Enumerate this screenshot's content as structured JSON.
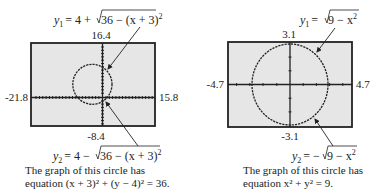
{
  "panels": [
    {
      "id": "left",
      "window": {
        "xmin": "-21.8",
        "xmax": "15.8",
        "ymin": "-8.4",
        "ymax": "16.4"
      },
      "top_equation": {
        "lhs": "y",
        "sub": "1",
        "rhs_prefix": "= 4 + ",
        "radicand": "36 − (x + 3)",
        "exp": "2"
      },
      "bottom_equation": {
        "lhs": "y",
        "sub": "2",
        "rhs_prefix": "= 4 − ",
        "radicand": "36 − (x + 3)",
        "exp": "2"
      },
      "caption_line1": "The graph of this circle has",
      "caption_line2": "equation (x + 3)² + (y − 4)² = 36.",
      "circle": {
        "center_x": -3,
        "center_y": 4,
        "radius": 6
      }
    },
    {
      "id": "right",
      "window": {
        "xmin": "-4.7",
        "xmax": "4.7",
        "ymin": "-3.1",
        "ymax": "3.1"
      },
      "top_equation": {
        "lhs": "y",
        "sub": "1",
        "rhs_prefix": "= ",
        "radicand": "9 − x",
        "exp": "2"
      },
      "bottom_equation": {
        "lhs": "y",
        "sub": "2",
        "rhs_prefix": "= −",
        "radicand": "9 − x",
        "exp": "2"
      },
      "caption_line1": "The graph of this circle has",
      "caption_line2": "equation x² + y² = 9.",
      "circle": {
        "center_x": 0,
        "center_y": 0,
        "radius": 3
      }
    }
  ],
  "colors": {
    "screen_fill": "#e6e6e6",
    "frame": "#222222",
    "curve": "#222222"
  }
}
